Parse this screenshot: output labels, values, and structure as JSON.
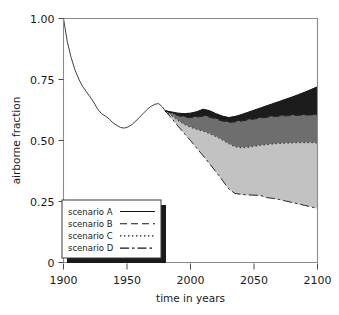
{
  "chart_data": {
    "type": "area",
    "title": "",
    "xlabel": "time in years",
    "ylabel": "airborne fraction",
    "xlim": [
      1900,
      2100
    ],
    "ylim": [
      0,
      1.0
    ],
    "xticks": [
      1900,
      1950,
      2000,
      2050,
      2100
    ],
    "xticklabels": [
      "1900",
      "1950",
      "2000",
      "2050",
      "2100"
    ],
    "yticks": [
      0,
      0.25,
      0.5,
      0.75,
      1.0
    ],
    "yticklabels": [
      "0",
      "0.25",
      "0.50",
      "0.75",
      "1.00"
    ],
    "grid": false,
    "legend_position": "lower left",
    "legend_entries": [
      {
        "label": "scenario A",
        "dash": "solid",
        "band_color": "#1c1c1c"
      },
      {
        "label": "scenario B",
        "dash": "dashed",
        "band_color": "#6e6e6e"
      },
      {
        "label": "scenario C",
        "dash": "dotted",
        "band_color": "#c2c2c2"
      },
      {
        "label": "scenario D",
        "dash": "dashdot",
        "band_color": "#ffffff"
      }
    ],
    "historical": {
      "name": "historical airborne fraction",
      "x": [
        1900,
        1903,
        1906,
        1909,
        1912,
        1915,
        1918,
        1921,
        1924,
        1927,
        1930,
        1933,
        1936,
        1939,
        1942,
        1945,
        1948,
        1951,
        1954,
        1957,
        1960,
        1963,
        1966,
        1969,
        1972,
        1975,
        1978,
        1980
      ],
      "y": [
        1.0,
        0.905,
        0.84,
        0.79,
        0.752,
        0.722,
        0.7,
        0.678,
        0.655,
        0.628,
        0.61,
        0.6,
        0.588,
        0.572,
        0.562,
        0.553,
        0.551,
        0.556,
        0.566,
        0.58,
        0.596,
        0.612,
        0.628,
        0.64,
        0.649,
        0.651,
        0.637,
        0.622
      ]
    },
    "series": [
      {
        "name": "scenario A",
        "dash": "solid",
        "x": [
          1980,
          1985,
          1990,
          1995,
          2000,
          2005,
          2010,
          2015,
          2020,
          2025,
          2030,
          2035,
          2040,
          2045,
          2050,
          2055,
          2060,
          2065,
          2070,
          2075,
          2080,
          2085,
          2090,
          2095,
          2100
        ],
        "y": [
          0.622,
          0.617,
          0.612,
          0.61,
          0.612,
          0.618,
          0.628,
          0.622,
          0.61,
          0.6,
          0.594,
          0.598,
          0.606,
          0.615,
          0.624,
          0.633,
          0.642,
          0.651,
          0.66,
          0.669,
          0.678,
          0.688,
          0.698,
          0.709,
          0.72
        ]
      },
      {
        "name": "scenario B",
        "dash": "dashed",
        "x": [
          1980,
          1985,
          1990,
          1995,
          2000,
          2005,
          2010,
          2015,
          2020,
          2025,
          2030,
          2035,
          2040,
          2045,
          2050,
          2055,
          2060,
          2065,
          2070,
          2075,
          2080,
          2085,
          2090,
          2095,
          2100
        ],
        "y": [
          0.622,
          0.612,
          0.602,
          0.596,
          0.594,
          0.596,
          0.6,
          0.596,
          0.588,
          0.58,
          0.574,
          0.576,
          0.58,
          0.584,
          0.588,
          0.592,
          0.595,
          0.598,
          0.6,
          0.601,
          0.602,
          0.603,
          0.604,
          0.605,
          0.605
        ]
      },
      {
        "name": "scenario C",
        "dash": "dotted",
        "x": [
          1980,
          1985,
          1990,
          1995,
          2000,
          2005,
          2010,
          2015,
          2020,
          2025,
          2030,
          2035,
          2040,
          2045,
          2050,
          2055,
          2060,
          2065,
          2070,
          2075,
          2080,
          2085,
          2090,
          2095,
          2100
        ],
        "y": [
          0.622,
          0.602,
          0.582,
          0.566,
          0.554,
          0.545,
          0.538,
          0.528,
          0.516,
          0.502,
          0.487,
          0.474,
          0.47,
          0.472,
          0.476,
          0.48,
          0.483,
          0.486,
          0.488,
          0.489,
          0.49,
          0.491,
          0.491,
          0.491,
          0.49
        ]
      },
      {
        "name": "scenario D",
        "dash": "dashdot",
        "x": [
          1980,
          1985,
          1990,
          1995,
          2000,
          2005,
          2010,
          2015,
          2020,
          2025,
          2030,
          2035,
          2040,
          2045,
          2050,
          2055,
          2060,
          2065,
          2070,
          2075,
          2080,
          2085,
          2090,
          2095,
          2100
        ],
        "y": [
          0.622,
          0.592,
          0.56,
          0.53,
          0.5,
          0.468,
          0.437,
          0.405,
          0.372,
          0.338,
          0.302,
          0.283,
          0.279,
          0.277,
          0.276,
          0.275,
          0.266,
          0.263,
          0.258,
          0.252,
          0.246,
          0.24,
          0.234,
          0.228,
          0.222
        ]
      }
    ]
  },
  "axes": {
    "xlabel": "time in years",
    "ylabel": "airborne fraction"
  }
}
